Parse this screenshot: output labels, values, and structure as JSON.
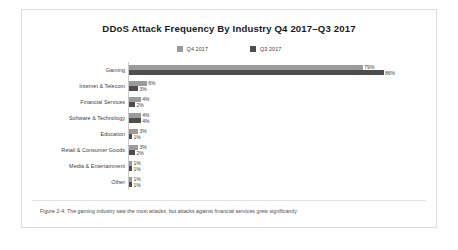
{
  "figure": {
    "caption": "Figure 2-4:  The gaming industry saw the most attacks, but attacks against financial services grew significantly"
  },
  "colors": {
    "series_q4": "#9b9b9b",
    "series_q3": "#4d4d4d",
    "axis": "#c8c8c8",
    "card_border": "#dcdcdc",
    "text": "#3c3c3c"
  },
  "chart_data": {
    "type": "bar",
    "orientation": "horizontal",
    "title": "DDoS Attack Frequency By Industry Q4 2017–Q3 2017",
    "xlabel": "",
    "ylabel": "",
    "xlim": [
      0,
      100
    ],
    "grid": false,
    "legend_position": "top-center",
    "value_suffix": "%",
    "categories": [
      "Gaming",
      "Internet & Telecom",
      "Financial Services",
      "Software & Technology",
      "Education",
      "Retail & Consumer Goods",
      "Media & Entertainment",
      "Other"
    ],
    "series": [
      {
        "name": "Q4 2017",
        "color": "#9b9b9b",
        "values": [
          79,
          6,
          4,
          4,
          3,
          3,
          1,
          1
        ],
        "labels": [
          "79%",
          "6%",
          "4%",
          "4%",
          "3%",
          "3%",
          "1%",
          "1%"
        ]
      },
      {
        "name": "Q3 2017",
        "color": "#4d4d4d",
        "values": [
          86,
          3,
          2,
          4,
          1,
          2,
          1,
          1
        ],
        "labels": [
          "86%",
          "3%",
          "2%",
          "4%",
          "1%",
          "2%",
          "1%",
          "1%"
        ]
      }
    ]
  }
}
